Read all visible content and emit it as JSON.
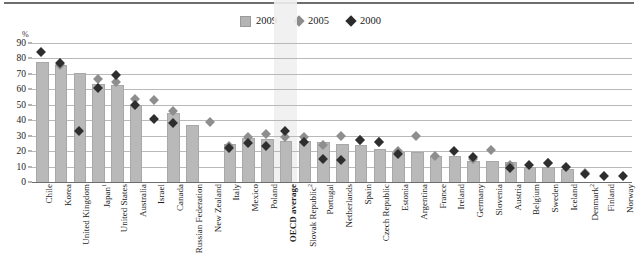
{
  "legend": {
    "items": [
      {
        "label": "2009",
        "marker": "bar-swatch-icon",
        "color": "#b4b4b4"
      },
      {
        "label": "2005",
        "marker": "diamond-icon",
        "color": "#8c8c8c"
      },
      {
        "label": "2000",
        "marker": "diamond-icon",
        "color": "#2b2b2b"
      }
    ]
  },
  "axis": {
    "unit_label": "%",
    "yticks": [
      "90",
      "80",
      "70",
      "60",
      "50",
      "40",
      "30",
      "20",
      "10",
      "0"
    ]
  },
  "highlight": {
    "category": "OECD average"
  },
  "chart_data": {
    "type": "bar",
    "title": "",
    "xlabel": "",
    "ylabel": "%",
    "ylim": [
      0,
      90
    ],
    "ytick_step": 10,
    "grid": true,
    "legend_position": "top-center",
    "categories": [
      "Chile",
      "Korea",
      "United Kingdom",
      "Japan¹",
      "United States",
      "Australia",
      "Israel",
      "Canada",
      "Russian Federation",
      "New Zealand",
      "Italy",
      "Mexico",
      "Poland",
      "OECD average",
      "Slovak Republic²",
      "Portugal",
      "Netherlands",
      "Spain",
      "Czech Republic",
      "Estonia",
      "Argentina",
      "France",
      "Ireland",
      "Germany",
      "Slovenia",
      "Austria",
      "Belgium",
      "Sweden",
      "Iceland",
      "Denmark²",
      "Finland",
      "Norway"
    ],
    "series": [
      {
        "name": "2009",
        "type": "bar",
        "color": "#b9b9b9",
        "values": [
          77,
          75,
          70,
          63,
          62,
          49,
          null,
          44,
          36,
          null,
          24,
          28,
          27,
          26,
          26,
          25,
          24,
          23,
          21,
          19,
          19,
          16,
          16,
          13,
          13,
          12,
          9,
          9,
          8,
          null,
          null,
          null
        ]
      },
      {
        "name": "2005",
        "type": "point",
        "color": "#8e8e8e",
        "values": [
          null,
          76,
          null,
          67,
          65,
          54,
          53,
          46,
          null,
          39,
          23,
          29,
          31,
          29,
          29,
          24,
          30,
          27,
          26,
          20,
          30,
          17,
          null,
          15,
          21,
          11,
          null,
          12,
          null,
          6,
          null,
          null
        ]
      },
      {
        "name": "2000",
        "type": "point",
        "color": "#2e2e2e",
        "values": [
          84,
          77,
          33,
          61,
          69,
          50,
          41,
          38,
          null,
          null,
          22,
          25,
          23,
          33,
          26,
          15,
          14,
          27,
          26,
          18,
          null,
          null,
          20,
          16,
          null,
          9,
          11,
          12,
          10,
          5,
          4,
          4
        ]
      }
    ]
  }
}
